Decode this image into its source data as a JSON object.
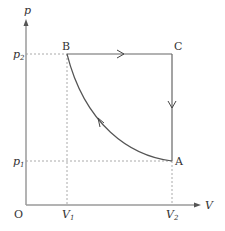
{
  "diagram": {
    "type": "p-V thermodynamic cycle",
    "axes": {
      "y_label": "p",
      "x_label": "V",
      "origin_label": "O"
    },
    "ticks": {
      "y": [
        {
          "base": "p",
          "sub": "2"
        },
        {
          "base": "p",
          "sub": "1"
        }
      ],
      "x": [
        {
          "base": "V",
          "sub": "1"
        },
        {
          "base": "V",
          "sub": "2"
        }
      ]
    },
    "points": {
      "A": {
        "label": "A",
        "V": "V2",
        "p": "p1"
      },
      "B": {
        "label": "B",
        "V": "V1",
        "p": "p2"
      },
      "C": {
        "label": "C",
        "V": "V2",
        "p": "p2"
      }
    },
    "processes": [
      {
        "from": "A",
        "to": "B",
        "shape": "curve",
        "direction": "A→B"
      },
      {
        "from": "B",
        "to": "C",
        "shape": "horizontal line (isobaric)",
        "direction": "B→C"
      },
      {
        "from": "C",
        "to": "A",
        "shape": "vertical line (isochoric)",
        "direction": "C→A"
      }
    ],
    "colors": {
      "axis": "#9a9a9a",
      "curve": "#555555",
      "dashed": "#aaaaaa",
      "text": "#333333"
    }
  }
}
